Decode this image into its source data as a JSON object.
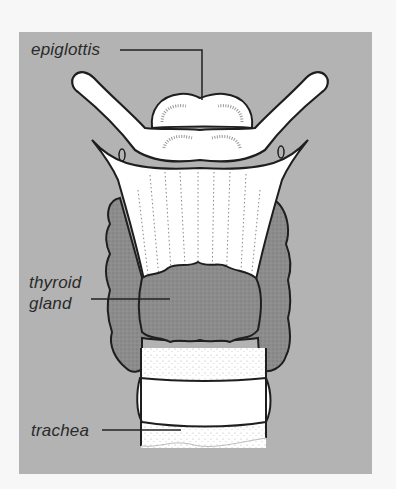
{
  "figure": {
    "background_color": "#b3b3b3",
    "page_color": "#f7f7f7"
  },
  "labels": {
    "epiglottis": "epiglottis",
    "thyroid_line1": "thyroid",
    "thyroid_line2": "gland",
    "trachea": "trachea"
  },
  "colors": {
    "cartilage": "#ffffff",
    "thyroid": "#8a8a8a",
    "outline": "#1e1e1e",
    "leader_line": "#222222"
  }
}
